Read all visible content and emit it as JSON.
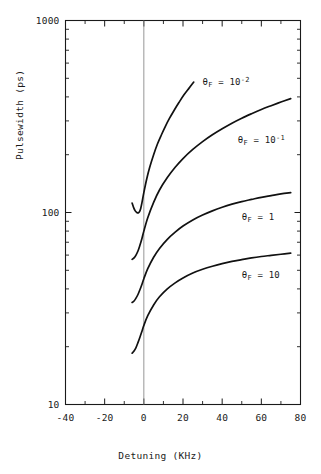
{
  "chart_data": {
    "type": "line",
    "title": "",
    "xlabel": "Detuning (KHz)",
    "ylabel": "Pulsewidth (ps)",
    "xlim": [
      -40,
      80
    ],
    "ylim": [
      10,
      1000
    ],
    "yscale": "log",
    "xscale": "linear",
    "grid": false,
    "legend_position": "inline-annotations",
    "xticks": [
      -40,
      -20,
      0,
      20,
      40,
      60,
      80
    ],
    "xtick_labels": [
      "-40",
      "-20",
      "0",
      "20",
      "40",
      "60",
      "80"
    ],
    "xminor_ticks": [
      -30,
      -10,
      10,
      30,
      50,
      70
    ],
    "yticks": [
      10,
      100,
      1000
    ],
    "ytick_labels": [
      "10",
      "100",
      "1000"
    ],
    "yminor_ticks": [
      20,
      30,
      40,
      50,
      60,
      70,
      80,
      90,
      200,
      300,
      400,
      500,
      600,
      700,
      800,
      900
    ],
    "vertical_reference_line": 0,
    "series": [
      {
        "name": "theta_F = 10^-2",
        "label_text": "θ",
        "label_sub": "F",
        "label_eq": " = 10",
        "label_sup": "-2",
        "points": [
          [
            -6.0,
            112.0
          ],
          [
            -5.2,
            106.0
          ],
          [
            -4.4,
            102.0
          ],
          [
            -3.6,
            100.0
          ],
          [
            -2.8,
            99.5
          ],
          [
            -2.2,
            101.0
          ],
          [
            -1.6,
            105.0
          ],
          [
            -1.0,
            112.0
          ],
          [
            0.0,
            127.0
          ],
          [
            1.5,
            150.0
          ],
          [
            3.0,
            172.0
          ],
          [
            5.0,
            200.0
          ],
          [
            7.0,
            228.0
          ],
          [
            9.0,
            254.0
          ],
          [
            11.0,
            281.0
          ],
          [
            13.0,
            308.0
          ],
          [
            15.5,
            341.0
          ],
          [
            18.0,
            375.0
          ],
          [
            20.5,
            410.0
          ],
          [
            23.0,
            443.0
          ],
          [
            25.5,
            478.0
          ]
        ]
      },
      {
        "name": "theta_F = 10^-1",
        "label_text": "θ",
        "label_sub": "F",
        "label_eq": " = 10",
        "label_sup": "-1",
        "points": [
          [
            -6.0,
            57.0
          ],
          [
            -5.0,
            58.0
          ],
          [
            -4.0,
            60.0
          ],
          [
            -3.0,
            63.0
          ],
          [
            -2.0,
            67.5
          ],
          [
            -1.0,
            73.0
          ],
          [
            0.0,
            80.0
          ],
          [
            2.0,
            94.0
          ],
          [
            5.0,
            113.0
          ],
          [
            8.0,
            131.0
          ],
          [
            12.0,
            152.0
          ],
          [
            16.0,
            172.0
          ],
          [
            20.0,
            191.0
          ],
          [
            25.0,
            213.0
          ],
          [
            30.0,
            234.0
          ],
          [
            35.0,
            254.0
          ],
          [
            40.0,
            273.0
          ],
          [
            45.0,
            292.0
          ],
          [
            50.0,
            310.0
          ],
          [
            55.0,
            327.0
          ],
          [
            60.0,
            344.0
          ],
          [
            65.0,
            360.0
          ],
          [
            70.0,
            376.0
          ],
          [
            75.0,
            392.0
          ]
        ]
      },
      {
        "name": "theta_F = 1",
        "label_text": "θ",
        "label_sub": "F",
        "label_eq": " = 1",
        "label_sup": "",
        "points": [
          [
            -6.0,
            34.0
          ],
          [
            -5.0,
            34.6
          ],
          [
            -4.0,
            35.8
          ],
          [
            -3.0,
            37.4
          ],
          [
            -2.0,
            39.6
          ],
          [
            -1.0,
            42.2
          ],
          [
            0.0,
            45.2
          ],
          [
            2.0,
            51.0
          ],
          [
            5.0,
            58.5
          ],
          [
            8.0,
            65.0
          ],
          [
            12.0,
            72.5
          ],
          [
            16.0,
            79.0
          ],
          [
            20.0,
            85.0
          ],
          [
            25.0,
            91.5
          ],
          [
            30.0,
            97.0
          ],
          [
            35.0,
            102.0
          ],
          [
            40.0,
            106.5
          ],
          [
            45.0,
            110.5
          ],
          [
            50.0,
            114.0
          ],
          [
            55.0,
            117.0
          ],
          [
            60.0,
            120.0
          ],
          [
            65.0,
            122.5
          ],
          [
            70.0,
            125.0
          ],
          [
            75.0,
            127.0
          ]
        ]
      },
      {
        "name": "theta_F = 10",
        "label_text": "θ",
        "label_sub": "F",
        "label_eq": " = 10",
        "label_sup": "",
        "points": [
          [
            -6.0,
            18.5
          ],
          [
            -5.0,
            19.0
          ],
          [
            -4.0,
            19.8
          ],
          [
            -3.0,
            21.0
          ],
          [
            -2.0,
            22.4
          ],
          [
            -1.0,
            24.0
          ],
          [
            0.0,
            25.8
          ],
          [
            2.0,
            29.0
          ],
          [
            5.0,
            33.0
          ],
          [
            8.0,
            36.4
          ],
          [
            12.0,
            40.0
          ],
          [
            16.0,
            43.0
          ],
          [
            20.0,
            45.6
          ],
          [
            25.0,
            48.4
          ],
          [
            30.0,
            50.6
          ],
          [
            35.0,
            52.5
          ],
          [
            40.0,
            54.2
          ],
          [
            45.0,
            55.6
          ],
          [
            50.0,
            56.8
          ],
          [
            55.0,
            58.0
          ],
          [
            60.0,
            59.0
          ],
          [
            65.0,
            59.8
          ],
          [
            70.0,
            60.6
          ],
          [
            75.0,
            61.4
          ]
        ]
      }
    ],
    "annotations": [
      {
        "id": "ann-1",
        "text": "θF = 10-2",
        "x": 30.0,
        "y": 470.0
      },
      {
        "id": "ann-2",
        "text": "θF = 10-1",
        "x": 48.0,
        "y": 235.0
      },
      {
        "id": "ann-3",
        "text": "θF = 1",
        "x": 50.0,
        "y": 93.0
      },
      {
        "id": "ann-4",
        "text": "θF = 10",
        "x": 50.0,
        "y": 46.0
      }
    ]
  },
  "colors": {
    "axis": "#1a1a1a",
    "curve": "#111111",
    "reference_line": "#8a8a8a",
    "background": "#ffffff"
  }
}
